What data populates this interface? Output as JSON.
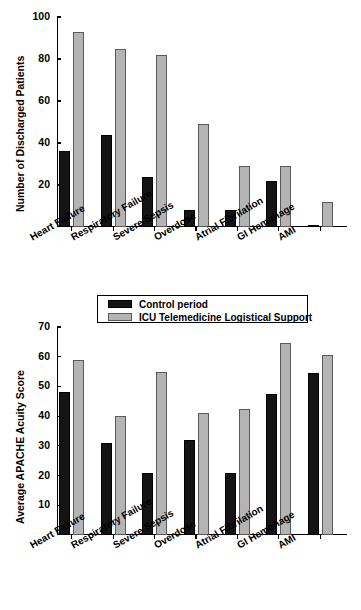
{
  "legend": {
    "position": "top-center-between-panels",
    "entries": [
      {
        "label": "Control period",
        "color": "#141414",
        "key": "control"
      },
      {
        "label": "ICU Telemedicine Logistical Support",
        "color": "#b4b4b4",
        "key": "telemedicine"
      }
    ]
  },
  "chart_data": [
    {
      "type": "bar",
      "title": "",
      "xlabel": "",
      "ylabel": "Number of Discharged Patients",
      "ylim": [
        0,
        100
      ],
      "yticks": [
        20,
        40,
        60,
        80,
        100
      ],
      "grid": false,
      "categories": [
        "Heart  Failure",
        "Respiratory Failure",
        "Severe Sepsis",
        "Overdose",
        "Atrial Fibrilation",
        "GI Hemohage",
        "AMI"
      ],
      "series": [
        {
          "name": "Control period",
          "color": "#141414",
          "values": [
            36,
            44,
            24,
            8,
            8,
            22,
            1
          ]
        },
        {
          "name": "ICU Telemedicine Logistical Support",
          "color": "#b4b4b4",
          "values": [
            93,
            85,
            82,
            49,
            29,
            29,
            12
          ]
        }
      ]
    },
    {
      "type": "bar",
      "title": "",
      "xlabel": "",
      "ylabel": "Average APACHE Acuity Score",
      "ylim": [
        0,
        70
      ],
      "yticks": [
        10,
        20,
        30,
        40,
        50,
        60,
        70
      ],
      "grid": false,
      "categories": [
        "Heart  Failure",
        "Respiratory Failure",
        "Severe Sepsis",
        "Overdose",
        "Atrial Fibrilation",
        "GI Hemohage",
        "AMI"
      ],
      "series": [
        {
          "name": "Control period",
          "color": "#141414",
          "values": [
            48,
            31,
            21,
            32,
            21,
            47.5,
            54.5
          ]
        },
        {
          "name": "ICU Telemedicine Logistical Support",
          "color": "#b4b4b4",
          "values": [
            59,
            40,
            55,
            41,
            42.5,
            64.5,
            60.5
          ]
        }
      ]
    }
  ]
}
